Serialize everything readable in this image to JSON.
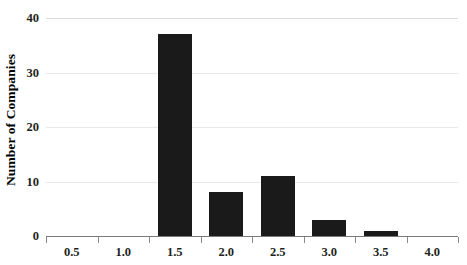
{
  "chart_data": {
    "type": "bar",
    "title": "",
    "xlabel": "",
    "ylabel": "Number of Companies",
    "categories": [
      "0.5",
      "1.0",
      "1.5",
      "2.0",
      "2.5",
      "3.0",
      "3.5",
      "4.0"
    ],
    "values": [
      0,
      0,
      37,
      8,
      11,
      3,
      1,
      0
    ],
    "ylim": [
      0,
      40
    ],
    "yticks": [
      "0",
      "10",
      "20",
      "30",
      "40"
    ],
    "ytick_values": [
      0,
      10,
      20,
      30,
      40
    ],
    "grid": "horizontal",
    "legend": "none",
    "bar_color": "#1a1a1a",
    "gridline_color": "#e8e8e8",
    "axis_color": "#7a7a7a"
  }
}
